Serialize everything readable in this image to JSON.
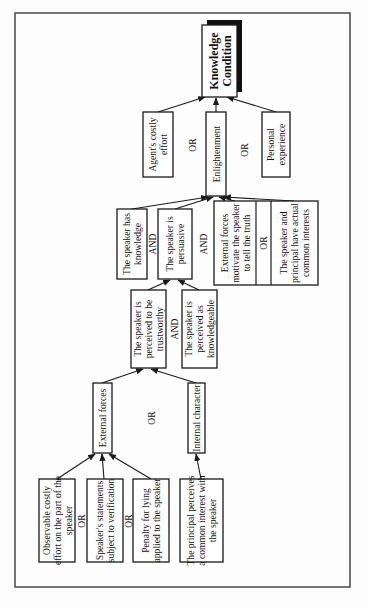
{
  "diagram": {
    "orientation": "rotated-90-ccw",
    "root": {
      "id": "knowledge_condition",
      "lines": [
        "Knowledge",
        "Condition"
      ]
    },
    "nodes": {
      "agents_costly_effort": {
        "lines": [
          "Agent's costly",
          "effort"
        ]
      },
      "enlightenment": {
        "lines": [
          "Enlightenment"
        ]
      },
      "personal_experience": {
        "lines": [
          "Personal",
          "experience"
        ]
      },
      "speaker_has_knowledge": {
        "lines": [
          "The speaker has",
          "knowledge"
        ]
      },
      "speaker_is_persuasive": {
        "lines": [
          "The speaker is",
          "persuasive"
        ]
      },
      "external_forces_motivate": {
        "lines": [
          "External forces",
          "motivate the speaker",
          "to tell the truth"
        ]
      },
      "actual_common_interests": {
        "lines": [
          "The speaker and",
          "principal have actual",
          "common interests"
        ]
      },
      "perceived_trustworthy": {
        "lines": [
          "The speaker is",
          "perceived to be",
          "trustworthy"
        ]
      },
      "perceived_knowledgeable": {
        "lines": [
          "The speaker is",
          "perceived as",
          "knowledgeable"
        ]
      },
      "external_forces": {
        "lines": [
          "External forces"
        ]
      },
      "internal_character": {
        "lines": [
          "Internal character"
        ]
      },
      "observable_costly_effort": {
        "lines": [
          "Observable costly",
          "effort on the part of the",
          "speaker"
        ]
      },
      "statements_verification": {
        "lines": [
          "Speaker's statements",
          "subject to verification"
        ]
      },
      "penalty_for_lying": {
        "lines": [
          "Penalty for lying",
          "applied to the speaker"
        ]
      },
      "principal_perceives_common_interest": {
        "lines": [
          "The principal perceives",
          "a common interest with",
          "the speaker"
        ]
      }
    },
    "operators": {
      "root_or_1": "OR",
      "root_or_2": "OR",
      "enlight_and_1": "AND",
      "enlight_and_2": "AND",
      "ext_or": "OR",
      "persuasive_and": "AND",
      "trust_or": "OR",
      "leaf_or_1": "OR",
      "leaf_or_2": "OR"
    },
    "edges": [
      {
        "from": "agents_costly_effort",
        "to": "knowledge_condition"
      },
      {
        "from": "enlightenment",
        "to": "knowledge_condition"
      },
      {
        "from": "personal_experience",
        "to": "knowledge_condition"
      },
      {
        "from": "speaker_has_knowledge",
        "to": "enlightenment"
      },
      {
        "from": "speaker_is_persuasive",
        "to": "enlightenment"
      },
      {
        "from": "external_forces_motivate",
        "to": "enlightenment"
      },
      {
        "from": "actual_common_interests",
        "to": "enlightenment"
      },
      {
        "from": "perceived_trustworthy",
        "to": "speaker_is_persuasive"
      },
      {
        "from": "perceived_knowledgeable",
        "to": "speaker_is_persuasive"
      },
      {
        "from": "external_forces",
        "to": "perceived_trustworthy"
      },
      {
        "from": "internal_character",
        "to": "perceived_trustworthy"
      },
      {
        "from": "observable_costly_effort",
        "to": "external_forces"
      },
      {
        "from": "statements_verification",
        "to": "external_forces"
      },
      {
        "from": "penalty_for_lying",
        "to": "external_forces"
      },
      {
        "from": "principal_perceives_common_interest",
        "to": "internal_character"
      }
    ]
  }
}
